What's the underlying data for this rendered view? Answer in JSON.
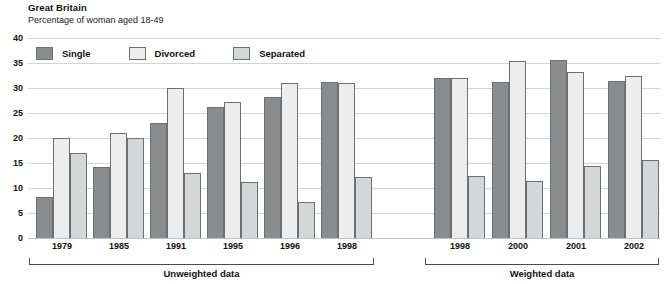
{
  "header": {
    "title": "Great Britain",
    "subtitle": "Percentage of woman aged 18-49"
  },
  "legend": [
    {
      "label": "Single",
      "color": "#8a8c8e"
    },
    {
      "label": "Divorced",
      "color": "#ededed"
    },
    {
      "label": "Separated",
      "color": "#d5d6d7"
    }
  ],
  "panels": [
    {
      "caption": "Unweighted data"
    },
    {
      "caption": "Weighted data"
    }
  ],
  "chart_data": {
    "type": "bar",
    "title": "Great Britain",
    "subtitle": "Percentage of woman aged 18-49",
    "xlabel": "",
    "ylabel": "",
    "ylim": [
      0,
      40
    ],
    "yticks": [
      0,
      5,
      10,
      15,
      20,
      25,
      30,
      35,
      40
    ],
    "grid": true,
    "legend_position": "top-left",
    "series_names": [
      "Single",
      "Divorced",
      "Separated"
    ],
    "panels": [
      {
        "name": "Unweighted data",
        "categories": [
          "1979",
          "1985",
          "1991",
          "1995",
          "1996",
          "1998"
        ],
        "series": [
          {
            "name": "Single",
            "values": [
              8.2,
              14.2,
              23.0,
              26.2,
              28.2,
              31.2
            ]
          },
          {
            "name": "Divorced",
            "values": [
              20.0,
              21.0,
              30.1,
              27.2,
              31.0,
              31.1
            ]
          },
          {
            "name": "Separated",
            "values": [
              17.1,
              20.0,
              13.1,
              11.3,
              7.3,
              12.2
            ]
          }
        ]
      },
      {
        "name": "Weighted data",
        "categories": [
          "1998",
          "2000",
          "2001",
          "2002"
        ],
        "series": [
          {
            "name": "Single",
            "values": [
              32.1,
              31.2,
              35.6,
              31.5
            ]
          },
          {
            "name": "Divorced",
            "values": [
              32.1,
              35.4,
              33.2,
              32.4
            ]
          },
          {
            "name": "Separated",
            "values": [
              12.4,
              11.5,
              14.5,
              15.6
            ]
          }
        ]
      }
    ]
  }
}
